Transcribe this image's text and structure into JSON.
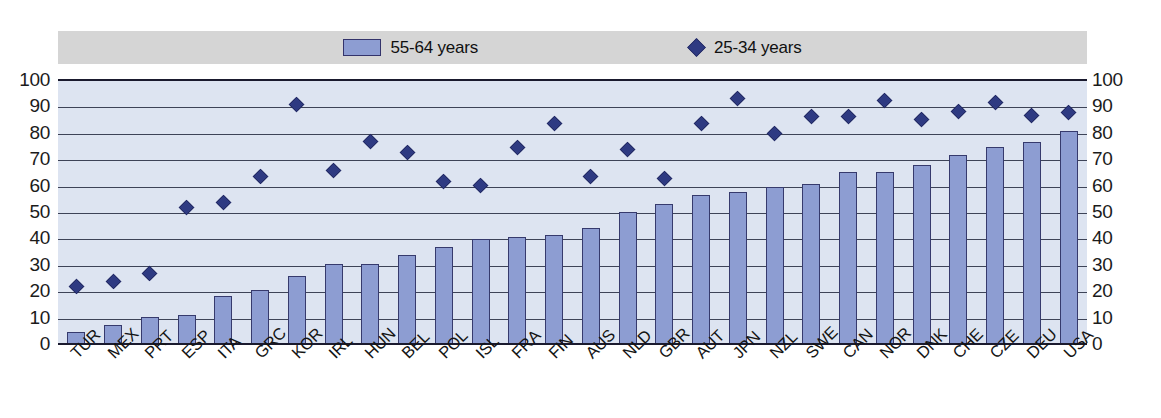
{
  "chart_data": {
    "type": "bar",
    "title": "",
    "subtitle": "",
    "xlabel": "",
    "ylabel": "",
    "ylim": [
      0,
      100
    ],
    "yticks": [
      0,
      10,
      20,
      30,
      40,
      50,
      60,
      70,
      80,
      90,
      100
    ],
    "grid": true,
    "legend_position": "top",
    "dual_y_axis": true,
    "categories": [
      "TUR",
      "MEX",
      "PRT",
      "ESP",
      "ITA",
      "GRC",
      "KOR",
      "IRL",
      "HUN",
      "BEL",
      "POL",
      "ISL",
      "FRA",
      "FIN",
      "AUS",
      "NLD",
      "GBR",
      "AUT",
      "JPN",
      "NZL",
      "SWE",
      "CAN",
      "NOR",
      "DNK",
      "CHE",
      "CZE",
      "DEU",
      "USA"
    ],
    "series": [
      {
        "name": "55-64 years",
        "type": "bar",
        "color": "#8d9dd2",
        "border_color": "#363a6d",
        "values": [
          5,
          7.5,
          10.5,
          11.5,
          18.5,
          21,
          26,
          30.5,
          30.5,
          34,
          37,
          40,
          41,
          41.5,
          44.5,
          50.5,
          53.5,
          57,
          58,
          60,
          61,
          65.5,
          65.5,
          68,
          72,
          75,
          77,
          81
        ]
      },
      {
        "name": "25-34 years",
        "type": "scatter",
        "marker": "diamond",
        "color": "#2e3a82",
        "values": [
          22,
          24,
          27,
          52,
          54,
          64,
          91,
          66,
          77,
          73,
          62,
          60.5,
          75,
          84,
          64,
          74,
          63,
          84,
          93.5,
          80,
          86.5,
          86.5,
          92.5,
          85.5,
          88.5,
          92,
          87,
          88
        ]
      }
    ]
  },
  "legend": {
    "entries": [
      {
        "label": "55-64 years",
        "marker": "bar-swatch"
      },
      {
        "label": "25-34 years",
        "marker": "diamond-swatch"
      }
    ]
  },
  "axes": {
    "left_ticks": [
      "100",
      "90",
      "80",
      "70",
      "60",
      "50",
      "40",
      "30",
      "20",
      "10",
      "0"
    ],
    "right_ticks": [
      "100",
      "90",
      "80",
      "70",
      "60",
      "50",
      "40",
      "30",
      "20",
      "10",
      "0"
    ]
  }
}
